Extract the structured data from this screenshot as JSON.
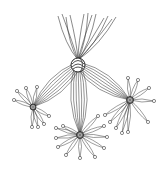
{
  "illustration": {
    "subject": "line drawing of knotted strands",
    "background": "#ffffff",
    "stroke": "#3a3a3a",
    "central_knot": {
      "x": 78,
      "y": 65,
      "r": 7
    },
    "top_strands": [
      {
        "x": 58,
        "y": 16
      },
      {
        "x": 62,
        "y": 14
      },
      {
        "x": 66,
        "y": 17
      },
      {
        "x": 70,
        "y": 15
      },
      {
        "x": 84,
        "y": 14
      },
      {
        "x": 88,
        "y": 13
      },
      {
        "x": 92,
        "y": 15
      },
      {
        "x": 96,
        "y": 14
      },
      {
        "x": 104,
        "y": 18
      },
      {
        "x": 108,
        "y": 16
      },
      {
        "x": 112,
        "y": 19
      },
      {
        "x": 116,
        "y": 17
      }
    ],
    "nodes": [
      {
        "name": "left",
        "x": 33,
        "y": 107,
        "r": 3,
        "spokes": [
          {
            "x": 14,
            "y": 100
          },
          {
            "x": 17,
            "y": 91
          },
          {
            "x": 26,
            "y": 88
          },
          {
            "x": 37,
            "y": 87
          },
          {
            "x": 49,
            "y": 116
          },
          {
            "x": 44,
            "y": 124
          },
          {
            "x": 38,
            "y": 127
          },
          {
            "x": 32,
            "y": 127
          }
        ]
      },
      {
        "name": "bottom",
        "x": 80,
        "y": 135,
        "r": 3.5,
        "spokes": [
          {
            "x": 56,
            "y": 128
          },
          {
            "x": 56,
            "y": 138
          },
          {
            "x": 58,
            "y": 147
          },
          {
            "x": 66,
            "y": 155
          },
          {
            "x": 80,
            "y": 158
          },
          {
            "x": 95,
            "y": 157
          },
          {
            "x": 104,
            "y": 148
          },
          {
            "x": 107,
            "y": 137
          },
          {
            "x": 104,
            "y": 126
          },
          {
            "x": 98,
            "y": 116
          },
          {
            "x": 63,
            "y": 126
          }
        ]
      },
      {
        "name": "right",
        "x": 130,
        "y": 100,
        "r": 3.5,
        "spokes": [
          {
            "x": 105,
            "y": 115
          },
          {
            "x": 110,
            "y": 122
          },
          {
            "x": 116,
            "y": 128
          },
          {
            "x": 122,
            "y": 133
          },
          {
            "x": 128,
            "y": 132
          },
          {
            "x": 148,
            "y": 122
          },
          {
            "x": 154,
            "y": 101
          },
          {
            "x": 149,
            "y": 88
          },
          {
            "x": 138,
            "y": 80
          },
          {
            "x": 128,
            "y": 78
          }
        ]
      }
    ]
  }
}
